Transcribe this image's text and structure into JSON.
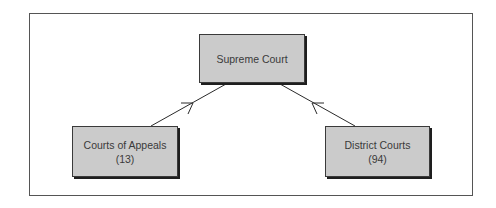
{
  "diagram": {
    "type": "hierarchy",
    "nodes": {
      "supreme": {
        "label": "Supreme Court",
        "count": ""
      },
      "appeals": {
        "label": "Courts of Appeals",
        "count": "(13)"
      },
      "district": {
        "label": "District Courts",
        "count": "(94)"
      }
    },
    "edges": [
      {
        "from": "Courts of Appeals",
        "to": "Supreme Court",
        "arrow": "toward-target"
      },
      {
        "from": "District Courts",
        "to": "Supreme Court",
        "arrow": "toward-target"
      }
    ],
    "colors": {
      "node_fill": "#cbcbcb",
      "node_border": "#3a3a3a",
      "shadow": "#1e1e1e",
      "frame_border": "#555555",
      "line": "#2a2a2a",
      "text": "#3a3a3a"
    }
  }
}
